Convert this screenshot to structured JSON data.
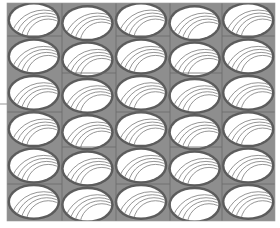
{
  "image": {
    "description": "Tiled grey pattern of horizontal ellipses with nested arcs",
    "columns": 5,
    "rows": 6,
    "colors": {
      "background": "#ffffff",
      "fill": "#8e8e8e",
      "rim": "#5c5c5c",
      "ellipse_inner": "#ffffff",
      "arc": "#7a7a7a",
      "grid_line": "#6a6a6a"
    },
    "bounds": {
      "left": 7,
      "top": 3,
      "right": 275,
      "bottom": 221
    },
    "vertical_lines_x": [
      62,
      116,
      170,
      222
    ],
    "left_tick_y": 104
  }
}
